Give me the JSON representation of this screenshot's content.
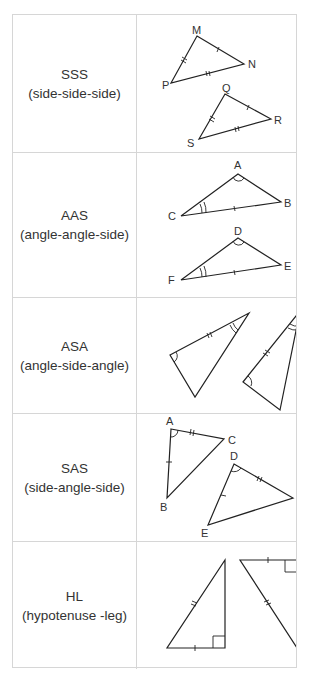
{
  "rows": [
    {
      "abbr": "SSS",
      "name": "(side-side-side)",
      "triangles": [
        [
          "M",
          "N",
          "P"
        ],
        [
          "Q",
          "R",
          "S"
        ]
      ]
    },
    {
      "abbr": "AAS",
      "name": "(angle-angle-side)",
      "triangles": [
        [
          "A",
          "B",
          "C"
        ],
        [
          "D",
          "E",
          "F"
        ]
      ]
    },
    {
      "abbr": "ASA",
      "name": "(angle-side-angle)",
      "triangles": [
        [],
        []
      ]
    },
    {
      "abbr": "SAS",
      "name": "(side-angle-side)",
      "triangles": [
        [
          "A",
          "B",
          "C"
        ],
        [
          "D",
          "E",
          "F"
        ]
      ]
    },
    {
      "abbr": "HL",
      "name": "(hypotenuse -leg)",
      "triangles": [
        [],
        []
      ]
    }
  ]
}
